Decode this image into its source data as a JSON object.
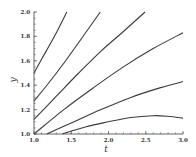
{
  "chart_data": {
    "type": "line",
    "title": "",
    "xlabel": "t",
    "ylabel": "y",
    "xlim": [
      1.0,
      3.0
    ],
    "ylim": [
      1.0,
      2.0
    ],
    "grid": false,
    "legend": null,
    "x_ticks": [
      "1.0",
      "1.5",
      "2.0",
      "2.5",
      "3.0"
    ],
    "y_ticks": [
      "1.0",
      "1.2",
      "1.4",
      "1.6",
      "1.8",
      "2.0"
    ],
    "series": [
      {
        "name": "curve-1",
        "points": [
          [
            1.0,
            1.5
          ],
          [
            1.1,
            1.61
          ],
          [
            1.2,
            1.72
          ],
          [
            1.3,
            1.83
          ],
          [
            1.44,
            2.0
          ]
        ]
      },
      {
        "name": "curve-2",
        "points": [
          [
            1.0,
            1.27
          ],
          [
            1.2,
            1.42
          ],
          [
            1.4,
            1.58
          ],
          [
            1.6,
            1.75
          ],
          [
            1.89,
            2.0
          ]
        ]
      },
      {
        "name": "curve-3",
        "points": [
          [
            1.0,
            1.12
          ],
          [
            1.3,
            1.31
          ],
          [
            1.6,
            1.5
          ],
          [
            1.9,
            1.68
          ],
          [
            2.2,
            1.84
          ],
          [
            2.49,
            2.0
          ]
        ]
      },
      {
        "name": "curve-4",
        "points": [
          [
            1.0,
            1.0
          ],
          [
            1.4,
            1.2
          ],
          [
            1.8,
            1.38
          ],
          [
            2.2,
            1.55
          ],
          [
            2.6,
            1.7
          ],
          [
            3.0,
            1.83
          ]
        ]
      },
      {
        "name": "curve-5",
        "points": [
          [
            1.17,
            1.0
          ],
          [
            1.5,
            1.09
          ],
          [
            1.9,
            1.2
          ],
          [
            2.3,
            1.3
          ],
          [
            2.7,
            1.38
          ],
          [
            3.0,
            1.43
          ]
        ]
      },
      {
        "name": "curve-6",
        "points": [
          [
            1.38,
            1.0
          ],
          [
            1.7,
            1.06
          ],
          [
            2.0,
            1.1
          ],
          [
            2.3,
            1.135
          ],
          [
            2.6,
            1.15
          ],
          [
            2.8,
            1.145
          ],
          [
            3.0,
            1.13
          ]
        ]
      }
    ]
  },
  "axes": {
    "x_label": "t",
    "y_label": "y"
  }
}
